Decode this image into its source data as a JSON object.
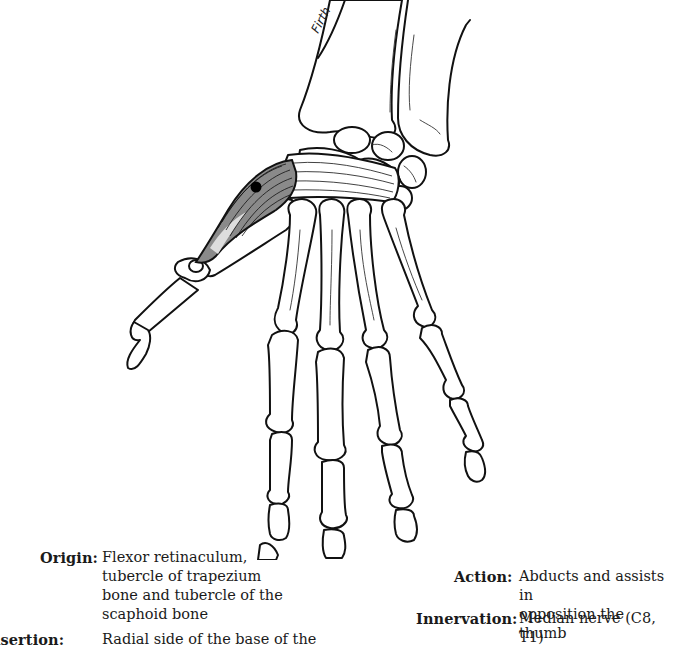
{
  "figure": {
    "signature": "Firth",
    "colors": {
      "muscle_fill": "#8a8a8a",
      "outline": "#111111",
      "background": "#ffffff",
      "origin_dot": "#000000"
    }
  },
  "captions": {
    "origin": {
      "label": "Origin:",
      "lines": [
        "Flexor retinaculum,",
        "tubercle of trapezium",
        "bone and tubercle of the",
        "scaphoid bone"
      ]
    },
    "insertion": {
      "label": "Insertion:",
      "visible_label": "ertion:",
      "lines": [
        "Radial side of the base of the"
      ]
    },
    "action": {
      "label": "Action:",
      "lines": [
        "Abducts and assists in",
        "opposition the thumb"
      ]
    },
    "innervation": {
      "label": "Innervation:",
      "lines": [
        "Median nerve (C8, T1)"
      ]
    }
  }
}
